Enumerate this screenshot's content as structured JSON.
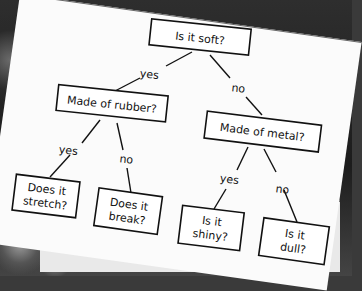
{
  "diagram": {
    "type": "decision-tree",
    "root": {
      "label": "Is it soft?"
    },
    "nodes": [
      {
        "id": "n0",
        "label": "Is it soft?"
      },
      {
        "id": "n1",
        "label": "Made of rubber?"
      },
      {
        "id": "n2",
        "label": "Made of metal?"
      },
      {
        "id": "n3",
        "label_line1": "Does it",
        "label_line2": "stretch?"
      },
      {
        "id": "n4",
        "label_line1": "Does it",
        "label_line2": "break?"
      },
      {
        "id": "n5",
        "label_line1": "Is it",
        "label_line2": "shiny?"
      },
      {
        "id": "n6",
        "label_line1": "Is it",
        "label_line2": "dull?"
      }
    ],
    "edges": [
      {
        "from": "n0",
        "to": "n1",
        "label": "yes"
      },
      {
        "from": "n0",
        "to": "n2",
        "label": "no"
      },
      {
        "from": "n1",
        "to": "n3",
        "label": "yes"
      },
      {
        "from": "n1",
        "to": "n4",
        "label": "no"
      },
      {
        "from": "n2",
        "to": "n5",
        "label": "yes"
      },
      {
        "from": "n2",
        "to": "n6",
        "label": "no"
      }
    ]
  }
}
